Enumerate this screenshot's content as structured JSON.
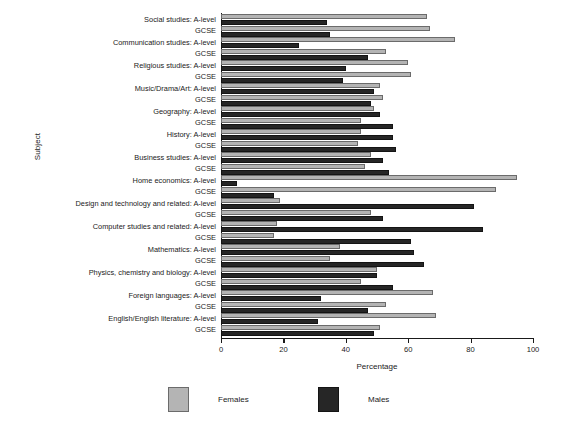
{
  "chart_data": {
    "type": "bar",
    "orientation": "horizontal",
    "title": "",
    "xlabel": "Percentage",
    "ylabel": "Subject",
    "xlim": [
      0,
      100
    ],
    "xticks": [
      0,
      20,
      40,
      60,
      80,
      100
    ],
    "grid": false,
    "legend_position": "bottom",
    "legend": [
      "Females",
      "Males"
    ],
    "categories": [
      "Social studies: A-level",
      "GCSE",
      "Communication studies: A-level",
      "GCSE",
      "Religious studies: A-level",
      "GCSE",
      "Music/Drama/Art: A-level",
      "GCSE",
      "Geography: A-level",
      "GCSE",
      "History: A-level",
      "GCSE",
      "Business studies: A-level",
      "GCSE",
      "Home economics: A-level",
      "GCSE",
      "Design and technology and related: A-level",
      "GCSE",
      "Computer studies and related: A-level",
      "GCSE",
      "Mathematics: A-level",
      "GCSE",
      "Physics, chemistry and biology: A-level",
      "GCSE",
      "Foreign languages: A-level",
      "GCSE",
      "English/English literature: A-level",
      "GCSE"
    ],
    "series": [
      {
        "name": "Females",
        "color": "#b4b4b4",
        "values": [
          66,
          67,
          75,
          53,
          60,
          61,
          51,
          52,
          49,
          45,
          45,
          44,
          48,
          46,
          95,
          88,
          19,
          48,
          18,
          17,
          38,
          35,
          50,
          45,
          68,
          53,
          69,
          51
        ]
      },
      {
        "name": "Males",
        "color": "#262626",
        "values": [
          34,
          35,
          25,
          47,
          40,
          39,
          49,
          48,
          51,
          55,
          55,
          56,
          52,
          54,
          5,
          17,
          81,
          52,
          84,
          61,
          62,
          65,
          50,
          55,
          32,
          47,
          31,
          49
        ]
      }
    ]
  },
  "axes": {
    "xlabel": "Percentage",
    "ylabel": "Subject",
    "xticklabels": [
      "0",
      "20",
      "40",
      "60",
      "80",
      "100"
    ]
  },
  "legend": {
    "females_label": "Females",
    "males_label": "Males",
    "females_color": "#b4b4b4",
    "males_color": "#262626"
  }
}
